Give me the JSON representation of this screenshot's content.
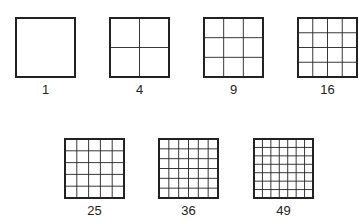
{
  "diagram": {
    "stroke_color": "#222222",
    "figures": [
      {
        "n": 1,
        "label": "1",
        "x": 15,
        "y": 17,
        "size": 61
      },
      {
        "n": 2,
        "label": "4",
        "x": 109,
        "y": 17,
        "size": 61
      },
      {
        "n": 3,
        "label": "9",
        "x": 203,
        "y": 17,
        "size": 61
      },
      {
        "n": 4,
        "label": "16",
        "x": 297,
        "y": 17,
        "size": 61
      },
      {
        "n": 5,
        "label": "25",
        "x": 64,
        "y": 138,
        "size": 61
      },
      {
        "n": 6,
        "label": "36",
        "x": 158,
        "y": 138,
        "size": 61
      },
      {
        "n": 7,
        "label": "49",
        "x": 253,
        "y": 138,
        "size": 61
      }
    ]
  }
}
